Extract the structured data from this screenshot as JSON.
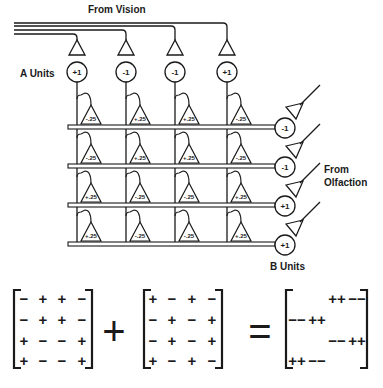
{
  "labels": {
    "from_vision": "From Vision",
    "a_units": "A Units",
    "from_olfaction_line1": "From",
    "from_olfaction_line2": "Olfaction",
    "b_units": "B Units"
  },
  "a_units": [
    "+1",
    "-1",
    "-1",
    "+1"
  ],
  "b_units": [
    "-1",
    "-1",
    "+1",
    "+1"
  ],
  "synapse_weights": [
    [
      "-.25",
      "+.25",
      "+.25",
      "-.25"
    ],
    [
      "-.25",
      "+.25",
      "+.25",
      "-.25"
    ],
    [
      "+.25",
      "-.25",
      "-.25",
      "+.25"
    ],
    [
      "+.25",
      "-.25",
      "-.25",
      "+.25"
    ]
  ],
  "equation": {
    "matrix_a": [
      [
        "−",
        "+",
        "+",
        "−"
      ],
      [
        "−",
        "+",
        "+",
        "−"
      ],
      [
        "+",
        "−",
        "−",
        "+"
      ],
      [
        "+",
        "−",
        "−",
        "+"
      ]
    ],
    "operator_plus": "+",
    "matrix_b": [
      [
        "+",
        "−",
        "+",
        "−"
      ],
      [
        "−",
        "+",
        "−",
        "+"
      ],
      [
        "−",
        "+",
        "−",
        "+"
      ],
      [
        "+",
        "−",
        "+",
        "−"
      ]
    ],
    "operator_equals": "=",
    "matrix_result": [
      [
        "",
        "",
        "++",
        "−−"
      ],
      [
        "−−",
        "++",
        "",
        ""
      ],
      [
        "",
        "",
        "−−",
        "++"
      ],
      [
        "++",
        "−−",
        "",
        ""
      ]
    ]
  },
  "colors": {
    "ink": "#1a1a1a",
    "background": "#ffffff"
  }
}
